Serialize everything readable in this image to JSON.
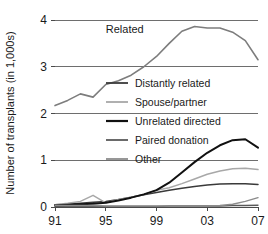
{
  "chart_data": {
    "type": "line",
    "title": "",
    "xlabel": "",
    "ylabel": "Number of transplants (in 1,000s)",
    "xlim": [
      1991,
      2007
    ],
    "ylim": [
      0,
      4
    ],
    "grid": true,
    "grid_axis": "y",
    "legend_position": "center-left-inside",
    "x": [
      1991,
      1992,
      1993,
      1994,
      1995,
      1996,
      1997,
      1998,
      1999,
      2000,
      2001,
      2002,
      2003,
      2004,
      2005,
      2006,
      2007
    ],
    "xticks": [
      1991,
      1995,
      1999,
      2003,
      2007
    ],
    "xtick_labels": [
      "91",
      "95",
      "99",
      "03",
      "07"
    ],
    "yticks": [
      0,
      1,
      2,
      3,
      4
    ],
    "ytick_labels": [
      "0",
      "1",
      "2",
      "3",
      "4"
    ],
    "annotations": [
      {
        "text": "Related",
        "x": 1996.5,
        "y": 3.72
      }
    ],
    "series": [
      {
        "name": "Related",
        "color": "#7d7d7d",
        "width": 1.6,
        "in_legend": false,
        "values": [
          2.17,
          2.28,
          2.42,
          2.35,
          2.62,
          2.7,
          2.82,
          3.0,
          3.22,
          3.5,
          3.76,
          3.86,
          3.83,
          3.83,
          3.74,
          3.56,
          3.15
        ]
      },
      {
        "name": "Distantly related",
        "color": "#3a3a3a",
        "width": 1.5,
        "in_legend": true,
        "values": [
          0.05,
          0.06,
          0.08,
          0.1,
          0.12,
          0.16,
          0.21,
          0.26,
          0.31,
          0.36,
          0.4,
          0.44,
          0.47,
          0.49,
          0.5,
          0.5,
          0.48
        ]
      },
      {
        "name": "Spouse/partner",
        "color": "#a8a8a8",
        "width": 1.5,
        "in_legend": true,
        "values": [
          0.05,
          0.08,
          0.12,
          0.25,
          0.09,
          0.16,
          0.21,
          0.27,
          0.36,
          0.41,
          0.5,
          0.6,
          0.7,
          0.77,
          0.82,
          0.83,
          0.8
        ]
      },
      {
        "name": "Unrelated directed",
        "color": "#111111",
        "width": 2.0,
        "in_legend": true,
        "values": [
          0.04,
          0.05,
          0.06,
          0.07,
          0.09,
          0.14,
          0.2,
          0.27,
          0.36,
          0.52,
          0.74,
          0.96,
          1.16,
          1.32,
          1.43,
          1.45,
          1.27
        ]
      },
      {
        "name": "Paired donation",
        "color": "#5a5a5a",
        "width": 1.5,
        "in_legend": true,
        "values": [
          0.01,
          0.01,
          0.01,
          0.01,
          0.01,
          0.01,
          0.01,
          0.01,
          0.01,
          0.02,
          0.02,
          0.02,
          0.02,
          0.02,
          0.03,
          0.03,
          0.04
        ]
      },
      {
        "name": "Other",
        "color": "#8c8c8c",
        "width": 1.5,
        "in_legend": true,
        "values": [
          0.04,
          0.03,
          0.03,
          0.03,
          0.02,
          0.02,
          0.02,
          0.02,
          0.02,
          0.02,
          0.02,
          0.02,
          0.02,
          0.03,
          0.06,
          0.12,
          0.2
        ]
      }
    ],
    "legend_entries": [
      {
        "label": "Distantly related",
        "color": "#3a3a3a"
      },
      {
        "label": "Spouse/partner",
        "color": "#a8a8a8"
      },
      {
        "label": "Unrelated directed",
        "color": "#111111"
      },
      {
        "label": "Paired donation",
        "color": "#5a5a5a"
      },
      {
        "label": "Other",
        "color": "#8c8c8c"
      }
    ]
  }
}
